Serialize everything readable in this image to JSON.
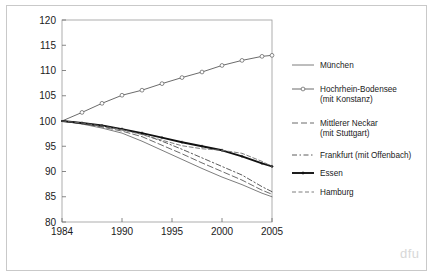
{
  "figure": {
    "watermark": "dfu",
    "border_color": "#c9c9c9",
    "background": "#ffffff"
  },
  "axes": {
    "y_ticks": [
      "120",
      "115",
      "110",
      "105",
      "100",
      "95",
      "90",
      "85",
      "80"
    ],
    "x_ticks": [
      "1984",
      "1990",
      "1995",
      "2000",
      "2005"
    ]
  },
  "legend": {
    "entries": [
      {
        "label": "München",
        "style": "solid",
        "marker": "none",
        "color": "#6e6e6e"
      },
      {
        "label": "Hochrhein-Bodensee",
        "label2": "(mit Konstanz)",
        "style": "solid",
        "marker": "circle",
        "color": "#5a5a5a"
      },
      {
        "label": "Mittlerer Neckar",
        "label2": "(mit Stuttgart)",
        "style": "longdash",
        "marker": "none",
        "color": "#5a5a5a"
      },
      {
        "label": "Frankfurt (mit Offenbach)",
        "style": "dashdot",
        "marker": "none",
        "color": "#4a4a4a"
      },
      {
        "label": "Essen",
        "style": "solid-thick",
        "marker": "star",
        "color": "#111111"
      },
      {
        "label": "Hamburg",
        "style": "dashdash",
        "marker": "none",
        "color": "#707070"
      }
    ]
  },
  "chart_data": {
    "type": "line",
    "title": "",
    "xlabel": "",
    "ylabel": "",
    "xlim": [
      1984,
      2005
    ],
    "ylim": [
      80,
      120
    ],
    "y_tick_values": [
      80,
      85,
      90,
      95,
      100,
      105,
      110,
      115,
      120
    ],
    "x_tick_values": [
      1984,
      1990,
      1995,
      2000,
      2005
    ],
    "grid": false,
    "legend_position": "right",
    "x": [
      1984,
      1986,
      1988,
      1990,
      1992,
      1994,
      1996,
      1998,
      2000,
      2002,
      2004,
      2005
    ],
    "series": [
      {
        "name": "München",
        "values": [
          100,
          99.4,
          98.6,
          97.6,
          96.0,
          94.2,
          92.4,
          90.6,
          88.9,
          87.4,
          85.7,
          85.0
        ]
      },
      {
        "name": "Hochrhein-Bodensee (mit Konstanz)",
        "values": [
          100,
          101.7,
          103.5,
          105.1,
          106.1,
          107.4,
          108.6,
          109.7,
          111.0,
          112.0,
          112.8,
          113.0
        ]
      },
      {
        "name": "Mittlerer Neckar (mit Stuttgart)",
        "values": [
          100,
          99.5,
          98.8,
          98.0,
          96.9,
          95.2,
          93.5,
          91.7,
          90.0,
          88.3,
          86.3,
          85.5
        ]
      },
      {
        "name": "Frankfurt (mit Offenbach)",
        "values": [
          100,
          99.6,
          99.0,
          98.3,
          97.4,
          96.0,
          94.4,
          92.7,
          91.0,
          89.3,
          87.0,
          86.0
        ]
      },
      {
        "name": "Essen",
        "values": [
          100,
          99.6,
          99.1,
          98.4,
          97.6,
          96.7,
          95.8,
          95.0,
          94.2,
          93.0,
          91.6,
          91.0
        ]
      },
      {
        "name": "Hamburg",
        "values": [
          100,
          99.6,
          99.0,
          98.3,
          97.3,
          96.2,
          95.1,
          94.5,
          94.2,
          93.6,
          92.0,
          91.0
        ]
      }
    ]
  }
}
